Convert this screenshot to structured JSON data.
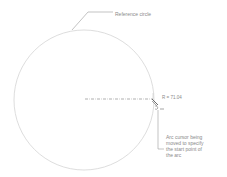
{
  "diagram": {
    "annotations": {
      "reference_circle": "Reference circle",
      "radius_readout": "R = 71.04",
      "arc_note": {
        "lines": [
          "Arc cursor being",
          "moved to specify",
          "the start point of",
          "the arc"
        ]
      }
    },
    "colors": {
      "circle_stroke": "#d4d4d4",
      "leader_stroke": "#9a9a9a",
      "centerline_stroke": "#8c8c8c",
      "cursor_stroke": "#6a6a6a",
      "text": "#8a8a8a"
    },
    "geometry": {
      "circle_center": [
        84,
        100
      ],
      "circle_radius": 70
    }
  }
}
